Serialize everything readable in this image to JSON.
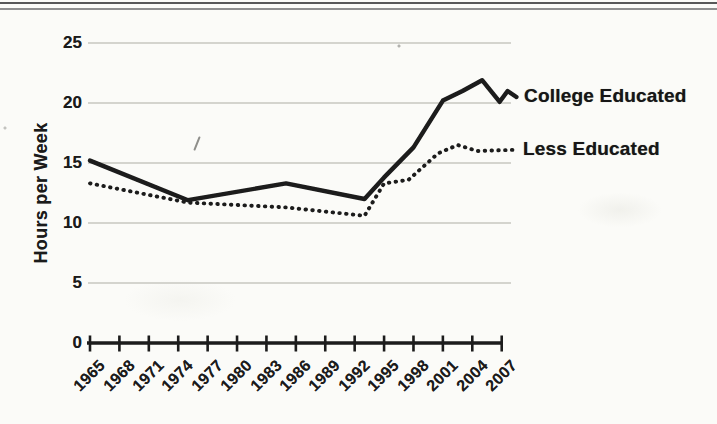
{
  "page": {
    "background": "#fbfbf8",
    "ink_color": "#1b1b1b",
    "gridline_color": "#c7c7c1",
    "top_rule_colors": [
      "#585858",
      "#8f8f8f"
    ]
  },
  "chart_data": {
    "type": "line",
    "title": "",
    "xlabel": "",
    "ylabel": "Hours per Week",
    "categories": [
      "1965",
      "1968",
      "1971",
      "1974",
      "1977",
      "1980",
      "1983",
      "1986",
      "1989",
      "1992",
      "1995",
      "1998",
      "2001",
      "2004",
      "2007"
    ],
    "y_ticks": [
      0,
      5,
      10,
      15,
      20,
      25
    ],
    "ylim": [
      0,
      25
    ],
    "xlim": [
      1965,
      2008.5
    ],
    "grid": "horizontal-light-gray",
    "legend_position": "labels-at-line-ends-right",
    "series": [
      {
        "name": "College Educated",
        "line_style": "solid",
        "color": "#1b1b1b",
        "points": [
          [
            1965,
            15.2
          ],
          [
            1975,
            11.9
          ],
          [
            1985,
            13.3
          ],
          [
            1993,
            12.0
          ],
          [
            1995,
            13.8
          ],
          [
            1998,
            16.3
          ],
          [
            2001,
            20.2
          ],
          [
            2003,
            21.0
          ],
          [
            2005,
            21.9
          ],
          [
            2006.8,
            20.1
          ],
          [
            2007.6,
            21.0
          ],
          [
            2008.5,
            20.5
          ]
        ]
      },
      {
        "name": "Less Educated",
        "line_style": "dotted",
        "color": "#1b1b1b",
        "points": [
          [
            1965,
            13.3
          ],
          [
            1975,
            11.7
          ],
          [
            1985,
            11.3
          ],
          [
            1993,
            10.6
          ],
          [
            1995,
            13.3
          ],
          [
            1997.5,
            13.6
          ],
          [
            2000.5,
            15.8
          ],
          [
            2002.5,
            16.5
          ],
          [
            2004.5,
            16.0
          ],
          [
            2008.3,
            16.1
          ]
        ]
      }
    ]
  }
}
